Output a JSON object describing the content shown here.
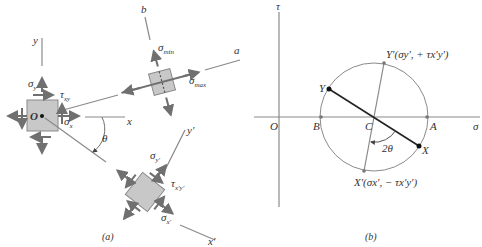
{
  "figure": {
    "panel_a": {
      "caption": "(a)",
      "axes": {
        "x": "x",
        "y": "y",
        "x_prime": "x'",
        "y_prime": "y'",
        "a": "a",
        "b": "b"
      },
      "origin": "O",
      "angle": "θ",
      "stresses": {
        "sigma_x": "σ",
        "sigma_x_sub": "x",
        "sigma_y": "σ",
        "sigma_y_sub": "y",
        "tau_xy": "τ",
        "tau_xy_sub": "xy",
        "sigma_min": "σ",
        "sigma_min_sub": "min",
        "sigma_max": "σ",
        "sigma_max_sub": "max",
        "sigma_yp": "σ",
        "sigma_yp_sub": "y'",
        "sigma_xp": "σ",
        "sigma_xp_sub": "x'",
        "tau_xpyp": "τ",
        "tau_xpyp_sub": "x'y'"
      }
    },
    "panel_b": {
      "caption": "(b)",
      "axes": {
        "horizontal": "σ",
        "vertical": "τ"
      },
      "points": {
        "O": "O",
        "B": "B",
        "C": "C",
        "A": "A",
        "X": "X",
        "Y": "Y",
        "Y_prime": "Y'(σy', + τx'y')",
        "X_prime": "X'(σx', − τx'y')"
      },
      "angle": "2θ"
    },
    "colors": {
      "line": "#8a8a8a",
      "element_fill": "#c8c8c8",
      "diameter": "#222222",
      "text": "#333333"
    }
  }
}
